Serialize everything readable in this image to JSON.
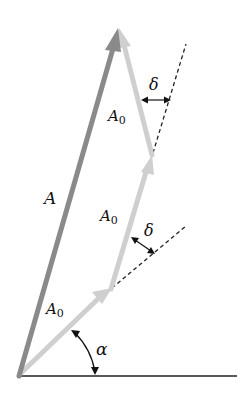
{
  "diagram": {
    "type": "vector phasor addition",
    "labels": {
      "resultant": "A",
      "phasor": "A",
      "phasor_sub": "0",
      "phase_step": "δ",
      "angle": "α"
    },
    "colors": {
      "resultant": "#8a8a8a",
      "phasor": "#cfcfcf",
      "baseline": "#222222",
      "dashed": "#222222"
    },
    "phasor_count": 3
  }
}
